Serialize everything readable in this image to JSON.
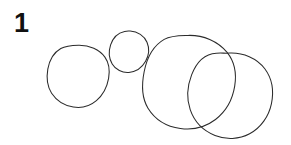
{
  "canvas": {
    "width": 291,
    "height": 145,
    "background_color": "#ffffff"
  },
  "figure": {
    "label": "1",
    "label_color": "#111111",
    "label_position": {
      "x": 14,
      "y": 8
    }
  },
  "sketch": {
    "stroke_color": "#2b2b2b",
    "stroke_width": 1.05,
    "fill": "none",
    "shape_count": 4,
    "shapes": [
      {
        "name": "circle-1",
        "type": "circle",
        "center_x": 78,
        "center_y": 76,
        "radius": 31,
        "size": "medium"
      },
      {
        "name": "circle-2",
        "type": "circle",
        "center_x": 129,
        "center_y": 51,
        "radius": 20,
        "size": "small"
      },
      {
        "name": "circle-3",
        "type": "circle",
        "center_x": 189,
        "center_y": 82,
        "radius": 47,
        "size": "large"
      },
      {
        "name": "circle-4",
        "type": "circle",
        "center_x": 231,
        "center_y": 96,
        "radius": 43,
        "size": "large"
      }
    ]
  }
}
